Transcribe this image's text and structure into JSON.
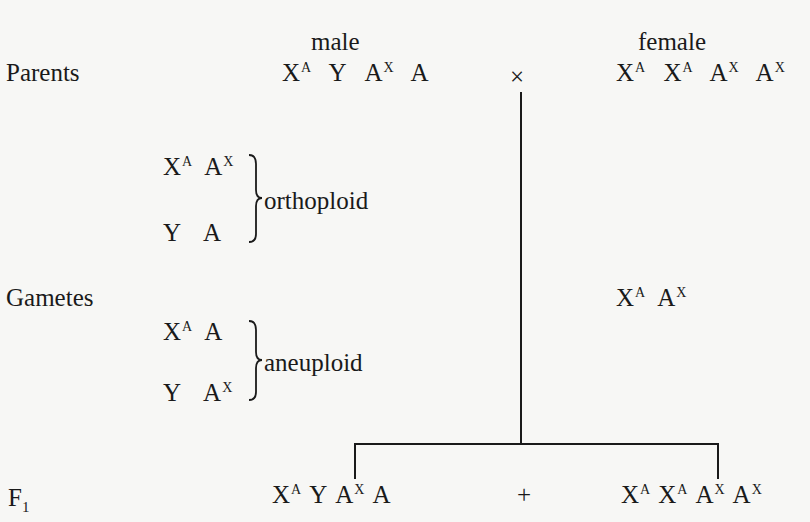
{
  "headers": {
    "male": "male",
    "female": "female"
  },
  "rows": {
    "parents": "Parents",
    "gametes": "Gametes",
    "f1_main": "F",
    "f1_sub": "1"
  },
  "cross_symbol": "×",
  "plus_symbol": "+",
  "male_parent": [
    {
      "base": "X",
      "sup": "A"
    },
    {
      "base": "Y",
      "sup": ""
    },
    {
      "base": "A",
      "sup": "X"
    },
    {
      "base": "A",
      "sup": ""
    }
  ],
  "female_parent": [
    {
      "base": "X",
      "sup": "A"
    },
    {
      "base": "X",
      "sup": "A"
    },
    {
      "base": "A",
      "sup": "X"
    },
    {
      "base": "A",
      "sup": "X"
    }
  ],
  "gametes": {
    "orthoploid_label": "orthoploid",
    "orthoploid": [
      [
        {
          "base": "X",
          "sup": "A"
        },
        {
          "base": "A",
          "sup": "X"
        }
      ],
      [
        {
          "base": "Y",
          "sup": ""
        },
        {
          "base": "A",
          "sup": ""
        }
      ]
    ],
    "aneuploid_label": "aneuploid",
    "aneuploid": [
      [
        {
          "base": "X",
          "sup": "A"
        },
        {
          "base": "A",
          "sup": ""
        }
      ],
      [
        {
          "base": "Y",
          "sup": ""
        },
        {
          "base": "A",
          "sup": "X"
        }
      ]
    ],
    "female": [
      {
        "base": "X",
        "sup": "A"
      },
      {
        "base": "A",
        "sup": "X"
      }
    ]
  },
  "f1": {
    "male": [
      {
        "base": "X",
        "sup": "A"
      },
      {
        "base": "Y",
        "sup": ""
      },
      {
        "base": "A",
        "sup": "X"
      },
      {
        "base": "A",
        "sup": ""
      }
    ],
    "female": [
      {
        "base": "X",
        "sup": "A"
      },
      {
        "base": "X",
        "sup": "A"
      },
      {
        "base": "A",
        "sup": "X"
      },
      {
        "base": "A",
        "sup": "X"
      }
    ]
  }
}
